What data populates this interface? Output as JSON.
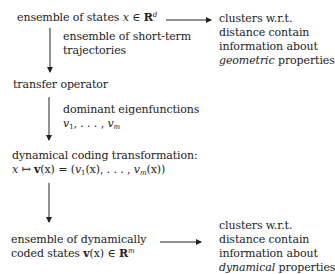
{
  "nodes": {
    "states": {
      "pre": "ensemble of states ",
      "var": "x",
      "op": " ∈ ",
      "space": "R",
      "dim": "d"
    },
    "transfer": {
      "label": "transfer operator"
    },
    "coding": {
      "line1": "dynamical coding transformation:",
      "formula": {
        "x": "x",
        "maps": " ↦ ",
        "v": "v",
        "arg": "(x) = (",
        "v1": "v",
        "s1": "1",
        "a1": "(x), . . . , ",
        "vm": "v",
        "sm": "m",
        "am": "(x))"
      }
    },
    "coded": {
      "line1": "ensemble of dynamically",
      "pre2": "coded states ",
      "v": "v",
      "arg": "(x) ∈ ",
      "space": "R",
      "dim": "m"
    }
  },
  "edge_labels": {
    "short_term": {
      "line1": "ensemble of short-term",
      "line2": "trajectories"
    },
    "eigen": {
      "line1": "dominant eigenfunctions",
      "v1": "v",
      "s1": "1",
      "mid": ", . . . , ",
      "vm": "v",
      "sm": "m"
    }
  },
  "outcomes": {
    "geometric": {
      "line1": "clusters w.r.t.",
      "line2": "distance contain",
      "line3": "information about",
      "emph": "geometric",
      "rest": " properties"
    },
    "dynamical": {
      "line1": "clusters w.r.t.",
      "line2": "distance contain",
      "line3": "information about",
      "emph": "dynamical",
      "rest": " properties"
    }
  }
}
